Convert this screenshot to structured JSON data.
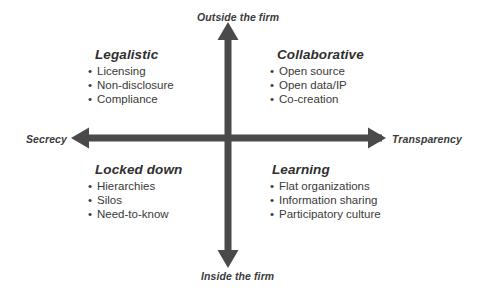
{
  "diagram": {
    "type": "2x2-matrix",
    "axes": {
      "vertical": {
        "top_label": "Outside the firm",
        "bottom_label": "Inside the firm",
        "arrow_color": "#4a4a4a"
      },
      "horizontal": {
        "left_label": "Secrecy",
        "right_label": "Transparency",
        "arrow_color": "#4a4a4a"
      }
    },
    "quadrants": [
      {
        "id": "legalistic",
        "position": "top-left",
        "title": "Legalistic",
        "items": [
          "Licensing",
          "Non-disclosure",
          "Compliance"
        ]
      },
      {
        "id": "collaborative",
        "position": "top-right",
        "title": "Collaborative",
        "items": [
          "Open source",
          "Open data/IP",
          "Co-creation"
        ]
      },
      {
        "id": "locked-down",
        "position": "bottom-left",
        "title": "Locked down",
        "items": [
          "Hierarchies",
          "Silos",
          "Need-to-know"
        ]
      },
      {
        "id": "learning",
        "position": "bottom-right",
        "title": "Learning",
        "items": [
          "Flat organizations",
          "Information sharing",
          "Participatory culture"
        ]
      }
    ],
    "bullet_glyph": "•",
    "colors": {
      "background": "#ffffff",
      "axis": "#4a4a4a",
      "title_text": "#2f2f2f",
      "body_text": "#3a3a3a",
      "axis_label_text": "#3b3b3b"
    }
  }
}
